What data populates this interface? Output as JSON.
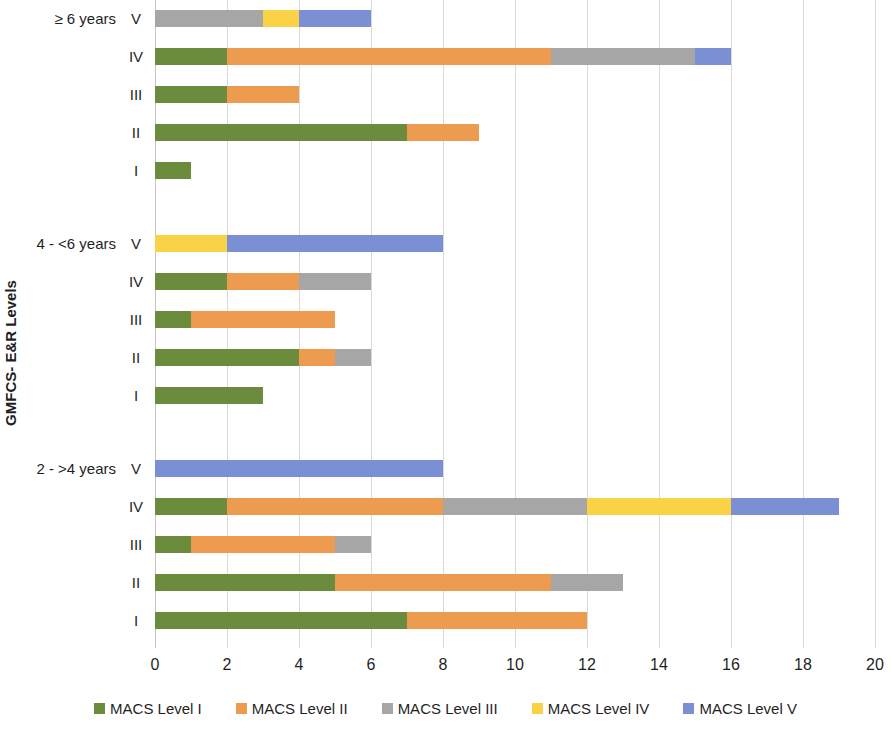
{
  "chart_data": {
    "type": "bar",
    "orientation": "horizontal",
    "stacked": true,
    "title": "",
    "xlabel": "",
    "ylabel": "GMFCS- E&R Levels",
    "xlim": [
      0,
      20
    ],
    "xticks": [
      0,
      2,
      4,
      6,
      8,
      10,
      12,
      14,
      16,
      18,
      20
    ],
    "xtick_labels": [
      "0",
      "2",
      "4",
      "6",
      "8",
      "10",
      "12",
      "14",
      "16",
      "18",
      "20"
    ],
    "grid": true,
    "legend_position": "bottom",
    "series": [
      {
        "name": "MACS Level I",
        "color": "#6c8c3d"
      },
      {
        "name": "MACS Level II",
        "color": "#ed9b4f"
      },
      {
        "name": "MACS Level III",
        "color": "#a6a6a6"
      },
      {
        "name": "MACS Level IV",
        "color": "#f9d246"
      },
      {
        "name": "MACS Level V",
        "color": "#7b8fd4"
      }
    ],
    "groups": [
      {
        "label": "≥ 6 years",
        "rows": [
          {
            "level": "V",
            "values": [
              0,
              0,
              3,
              1,
              2
            ],
            "total": 6
          },
          {
            "level": "IV",
            "values": [
              2,
              9,
              4,
              0,
              1
            ],
            "total": 16
          },
          {
            "level": "III",
            "values": [
              2,
              2,
              0,
              0,
              0
            ],
            "total": 4
          },
          {
            "level": "II",
            "values": [
              7,
              2,
              0,
              0,
              0
            ],
            "total": 9
          },
          {
            "level": "I",
            "values": [
              1,
              0,
              0,
              0,
              0
            ],
            "total": 1
          }
        ]
      },
      {
        "label": "4 - <6 years",
        "rows": [
          {
            "level": "V",
            "values": [
              0,
              0,
              0,
              2,
              6
            ],
            "total": 8
          },
          {
            "level": "IV",
            "values": [
              2,
              2,
              2,
              0,
              0
            ],
            "total": 6
          },
          {
            "level": "III",
            "values": [
              1,
              4,
              0,
              0,
              0
            ],
            "total": 5
          },
          {
            "level": "II",
            "values": [
              4,
              1,
              1,
              0,
              0
            ],
            "total": 6
          },
          {
            "level": "I",
            "values": [
              3,
              0,
              0,
              0,
              0
            ],
            "total": 3
          }
        ]
      },
      {
        "label": "2 - >4 years",
        "rows": [
          {
            "level": "V",
            "values": [
              0,
              0,
              0,
              0,
              8
            ],
            "total": 8
          },
          {
            "level": "IV",
            "values": [
              2,
              6,
              4,
              4,
              3
            ],
            "total": 19
          },
          {
            "level": "III",
            "values": [
              1,
              4,
              1,
              0,
              0
            ],
            "total": 6
          },
          {
            "level": "II",
            "values": [
              5,
              6,
              2,
              0,
              0
            ],
            "total": 13
          },
          {
            "level": "I",
            "values": [
              7,
              5,
              0,
              0,
              0
            ],
            "total": 12
          }
        ]
      }
    ]
  },
  "legend": {
    "items": [
      {
        "label": "MACS Level I",
        "color": "#6c8c3d"
      },
      {
        "label": "MACS Level II",
        "color": "#ed9b4f"
      },
      {
        "label": "MACS Level III",
        "color": "#a6a6a6"
      },
      {
        "label": "MACS Level IV",
        "color": "#f9d246"
      },
      {
        "label": "MACS Level V",
        "color": "#7b8fd4"
      }
    ]
  }
}
